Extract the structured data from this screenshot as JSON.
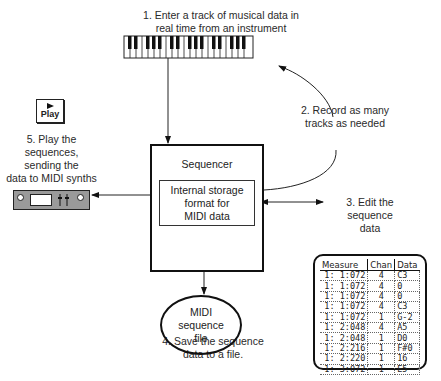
{
  "diagram": {
    "steps": {
      "step1": "1. Enter a track of musical data in real time from an instrument",
      "step1_line1": "1. Enter a track of musical data in",
      "step1_line2": "real time from an instrument",
      "step2_line1": "2. Record as many",
      "step2_line2": "tracks as needed",
      "step3_line1": "3. Edit the",
      "step3_line2": "sequence",
      "step3_line3": "data",
      "step4_line1": "4. Save the sequence",
      "step4_line2": "data to a file.",
      "step5_line1": "5. Play the",
      "step5_line2": "sequences,",
      "step5_line3": "sending the",
      "step5_line4": "data to MIDI synths"
    },
    "sequencer": {
      "title": "Sequencer",
      "inner_line1": "Internal storage",
      "inner_line2": "format for",
      "inner_line3": "MIDI data"
    },
    "file": {
      "line1": "MIDI",
      "line2": "sequence",
      "line3": "file"
    },
    "play_button": {
      "label": "Play",
      "icon": "play-triangle-icon"
    },
    "keyboard": {
      "icon": "piano-keyboard-icon"
    },
    "synth": {
      "icon": "midi-synth-module-icon"
    }
  },
  "event_list": {
    "headers": [
      "Measure",
      "Chan",
      "Data"
    ],
    "rows": [
      [
        "1:  1:072",
        "4",
        "C3"
      ],
      [
        "1:  1:072",
        "4",
        "0"
      ],
      [
        "1:  1:072",
        "4",
        "0"
      ],
      [
        "1:  1:072",
        "4",
        "C3"
      ],
      [
        "1:  1:072",
        "1",
        "G-2"
      ],
      [
        "1:  2:048",
        "4",
        "A5"
      ],
      [
        "1:  2:048",
        "1",
        "D0"
      ],
      [
        "1:  2:216",
        "1",
        "F#0"
      ],
      [
        "1:  2:220",
        "1",
        "16"
      ],
      [
        "1:  3:072",
        "1",
        "E5"
      ]
    ]
  }
}
